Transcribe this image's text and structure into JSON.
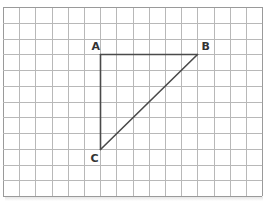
{
  "diagram": {
    "type": "triangle-on-grid",
    "grid": {
      "columns": 16,
      "rows": 12,
      "left": 3,
      "top": 7,
      "cell_w": 16.2,
      "cell_h": 15.75,
      "line_color": "#b8b8b8",
      "border_color": "#9a9a9a"
    },
    "shape_color": "#4a4a4a",
    "vertices": [
      {
        "label": "A",
        "col": 6,
        "row": 3,
        "label_dx": -9,
        "label_dy": -5
      },
      {
        "label": "B",
        "col": 12,
        "row": 3,
        "label_dx": 4,
        "label_dy": -5
      },
      {
        "label": "C",
        "col": 6,
        "row": 9,
        "label_dx": -10,
        "label_dy": 12
      }
    ],
    "edges": [
      [
        "A",
        "B"
      ],
      [
        "A",
        "C"
      ],
      [
        "B",
        "C"
      ]
    ]
  }
}
